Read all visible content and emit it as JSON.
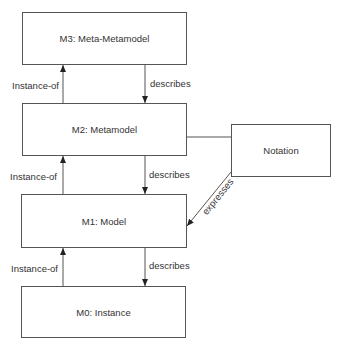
{
  "diagram": {
    "boxes": {
      "m3": "M3: Meta-Metamodel",
      "m2": "M2: Metamodel",
      "m1": "M1: Model",
      "m0": "M0: Instance",
      "notation": "Notation"
    },
    "edges": {
      "m2_m3_instance_of": "Instance-of",
      "m3_m2_describes": "describes",
      "m1_m2_instance_of": "Instance-of",
      "m2_m1_describes": "describes",
      "m0_m1_instance_of": "Instance-of",
      "m1_m0_describes": "describes",
      "notation_m1_expresses": "expresses"
    },
    "colors": {
      "line": "#555555",
      "text": "#333333",
      "background": "#ffffff"
    }
  }
}
